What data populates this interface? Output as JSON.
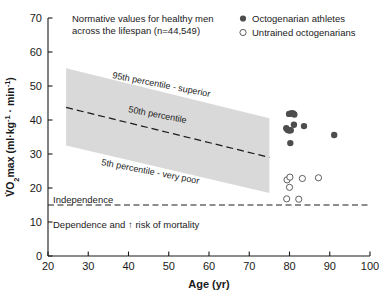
{
  "chart_data": {
    "type": "scatter",
    "title": "",
    "xlabel": "Age (yr)",
    "ylabel": "VO2max (ml·kg-1 · min-1)",
    "xlim": [
      20,
      100
    ],
    "ylim": [
      0,
      70
    ],
    "xticks": [
      20,
      30,
      40,
      50,
      60,
      70,
      80,
      90,
      100
    ],
    "yticks": [
      0,
      10,
      20,
      30,
      40,
      50,
      60,
      70
    ],
    "grid": false,
    "legend_position": "top-right",
    "legend": [
      {
        "label": "Octogenarian athletes",
        "marker": "filled-circle",
        "color": "#4d4d4d"
      },
      {
        "label": "Untrained octogenarians",
        "marker": "open-circle",
        "color": "#4d4d4d"
      }
    ],
    "annotations": [
      {
        "name": "normative-note",
        "text_line1": "Normative values for healthy men",
        "text_line2": "across the lifespan (n=44,549)"
      },
      {
        "name": "p95-label",
        "text": "95th percentile - superior"
      },
      {
        "name": "p50-label",
        "text": "50th percentile"
      },
      {
        "name": "p5-label",
        "text": "5th percentile - very poor"
      },
      {
        "name": "independence-label",
        "text": "Independence"
      },
      {
        "name": "dependence-label",
        "text": "Dependence and ↑ risk of mortality"
      }
    ],
    "bands": [
      {
        "name": "normative-range-5th-to-95th",
        "fill": "#d9d9d9",
        "x": [
          24.5,
          75
        ],
        "upper": [
          55.2,
          40.5
        ],
        "lower": [
          32.5,
          18.5
        ]
      }
    ],
    "lines": [
      {
        "name": "50th-percentile",
        "style": "dashed",
        "x": [
          24.5,
          75
        ],
        "y": [
          43.7,
          29.0
        ]
      },
      {
        "name": "mortality-threshold",
        "style": "dashed",
        "x": [
          20,
          100
        ],
        "y": [
          15,
          15
        ],
        "value": 15
      }
    ],
    "series": [
      {
        "name": "Octogenarian athletes",
        "marker": "filled-circle",
        "color": "#4d4d4d",
        "points": [
          {
            "x": 79.9,
            "y": 41.8
          },
          {
            "x": 80.5,
            "y": 42.0
          },
          {
            "x": 80.9,
            "y": 41.9
          },
          {
            "x": 81.2,
            "y": 41.6
          },
          {
            "x": 79.2,
            "y": 37.6
          },
          {
            "x": 79.5,
            "y": 37.1
          },
          {
            "x": 79.9,
            "y": 36.9
          },
          {
            "x": 80.3,
            "y": 37.0
          },
          {
            "x": 81.1,
            "y": 38.6
          },
          {
            "x": 83.6,
            "y": 38.2
          },
          {
            "x": 80.2,
            "y": 33.2
          },
          {
            "x": 91.1,
            "y": 35.6
          }
        ]
      },
      {
        "name": "Untrained octogenarians",
        "marker": "open-circle",
        "color": "#4d4d4d",
        "points": [
          {
            "x": 79.4,
            "y": 22.4
          },
          {
            "x": 80.1,
            "y": 23.2
          },
          {
            "x": 83.2,
            "y": 22.8
          },
          {
            "x": 80.0,
            "y": 20.2
          },
          {
            "x": 79.3,
            "y": 16.8
          },
          {
            "x": 82.3,
            "y": 16.7
          },
          {
            "x": 87.2,
            "y": 23.0
          }
        ]
      }
    ]
  },
  "axes": {
    "x_title": "Age (yr)",
    "y_title_parts": {
      "main": "VO",
      "sub": "2",
      "max": "max (ml·kg",
      "sup1": "-1",
      "mid": " · min",
      "sup2": "-1",
      "close": ")"
    },
    "x_tick_labels": [
      "20",
      "30",
      "40",
      "50",
      "60",
      "70",
      "80",
      "90",
      "100"
    ],
    "y_tick_labels": [
      "0",
      "10",
      "20",
      "30",
      "40",
      "50",
      "60",
      "70"
    ]
  },
  "legend": {
    "item_athletes": "Octogenarian athletes",
    "item_untrained": "Untrained octogenarians"
  },
  "notes": {
    "normative_line1": "Normative values for healthy men",
    "normative_line2": "across the lifespan (n=44,549)",
    "p95": "95th percentile - superior",
    "p50": "50th percentile",
    "p5": "5th percentile - very poor",
    "independence": "Independence",
    "dependence": "Dependence and ↑ risk of mortality"
  }
}
